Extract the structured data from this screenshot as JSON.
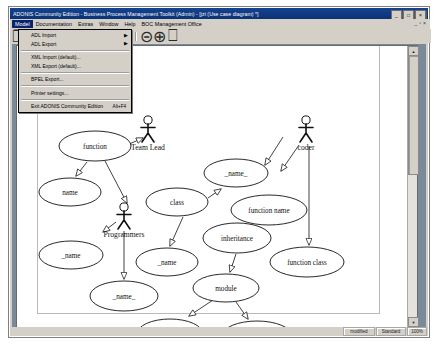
{
  "window": {
    "title": "ADONIS Community Edition - Business Process Management Toolkit (Admin) - [jzi (Use case diagram) *]",
    "minimize_label": "_",
    "maximize_label": "□",
    "close_label": "×",
    "mdi_minimize_label": "_",
    "mdi_restore_label": "▫",
    "mdi_close_label": "×"
  },
  "menubar": {
    "items": [
      {
        "label": "Model",
        "active": true
      },
      {
        "label": "Documentation",
        "active": false
      },
      {
        "label": "Extras",
        "active": false
      },
      {
        "label": "Window",
        "active": false
      },
      {
        "label": "Help",
        "active": false
      },
      {
        "label": "BOC Management Office",
        "active": false
      }
    ]
  },
  "model_menu": {
    "items": [
      {
        "label": "ADL Import",
        "submenu": "▶",
        "shortcut": ""
      },
      {
        "label": "ADL Export",
        "submenu": "▶",
        "shortcut": ""
      },
      {
        "separator": true
      },
      {
        "label": "XML Import (default)...",
        "submenu": "",
        "shortcut": ""
      },
      {
        "label": "XML Export (default)...",
        "submenu": "",
        "shortcut": ""
      },
      {
        "separator": true
      },
      {
        "label": "BPEL Export...",
        "submenu": "",
        "shortcut": ""
      },
      {
        "separator": true
      },
      {
        "label": "Printer settings...",
        "submenu": "",
        "shortcut": ""
      },
      {
        "separator": true
      },
      {
        "label": "Exit ADONIS Community Edition",
        "submenu": "",
        "shortcut": "Alt+F4"
      }
    ]
  },
  "toolbar": {
    "buttons": [
      {
        "name": "new-model-icon",
        "glyph": "❐"
      },
      {
        "name": "open-model-icon",
        "glyph": "◱"
      },
      {
        "name": "save-model-icon",
        "glyph": "▣"
      },
      {
        "name": "undo-icon",
        "glyph": "↺"
      },
      {
        "name": "redo-icon",
        "glyph": "↻"
      },
      {
        "name": "refresh-icon",
        "glyph": "⦾"
      },
      {
        "name": "align-top-icon",
        "glyph": "⤓"
      },
      {
        "name": "align-bottom-icon",
        "glyph": "⤒"
      },
      {
        "name": "zoom-out-icon",
        "glyph": "⊝"
      },
      {
        "name": "zoom-in-icon",
        "glyph": "⊕"
      },
      {
        "name": "print-preview-icon",
        "glyph": "⎕"
      }
    ]
  },
  "statusbar": {
    "cells": [
      "modified",
      "Standard",
      "100%"
    ]
  },
  "diagram": {
    "type": "uml-use-case-diagram",
    "actors": [
      {
        "id": "team-lead",
        "label": "Team Lead",
        "x": 131,
        "y": 83
      },
      {
        "id": "programmers",
        "label": "Programmers",
        "x": 107,
        "y": 170
      },
      {
        "id": "coder",
        "label": "coder",
        "x": 289,
        "y": 83
      }
    ],
    "use_cases": [
      {
        "id": "function",
        "label": "function",
        "cx": 78,
        "cy": 100,
        "rx": 36,
        "ry": 15
      },
      {
        "id": "name",
        "label": "name",
        "cx": 53,
        "cy": 146,
        "rx": 31,
        "ry": 14
      },
      {
        "id": "class",
        "label": "class",
        "cx": 160,
        "cy": 156,
        "rx": 31,
        "ry": 14
      },
      {
        "id": "name-u1",
        "label": "_name_",
        "cx": 219,
        "cy": 127,
        "rx": 32,
        "ry": 14
      },
      {
        "id": "function-name",
        "label": "function name",
        "cx": 252,
        "cy": 164,
        "rx": 38,
        "ry": 15
      },
      {
        "id": "inheritance",
        "label": "inheritance",
        "cx": 220,
        "cy": 192,
        "rx": 34,
        "ry": 15
      },
      {
        "id": "name-left",
        "label": "_name",
        "cx": 54,
        "cy": 209,
        "rx": 32,
        "ry": 14
      },
      {
        "id": "name-mid",
        "label": "_name",
        "cx": 150,
        "cy": 216,
        "rx": 31,
        "ry": 14
      },
      {
        "id": "function-class",
        "label": "function class",
        "cx": 290,
        "cy": 216,
        "rx": 37,
        "ry": 15
      },
      {
        "id": "module",
        "label": "module",
        "cx": 209,
        "cy": 242,
        "rx": 33,
        "ry": 14
      },
      {
        "id": "name-low",
        "label": "_name_",
        "cx": 107,
        "cy": 250,
        "rx": 34,
        "ry": 15
      },
      {
        "id": "name-bottom",
        "label": "_name_",
        "cx": 153,
        "cy": 288,
        "rx": 33,
        "ry": 15
      },
      {
        "id": "programmer",
        "label": "programmer",
        "cx": 240,
        "cy": 290,
        "rx": 35,
        "ry": 15
      }
    ]
  }
}
